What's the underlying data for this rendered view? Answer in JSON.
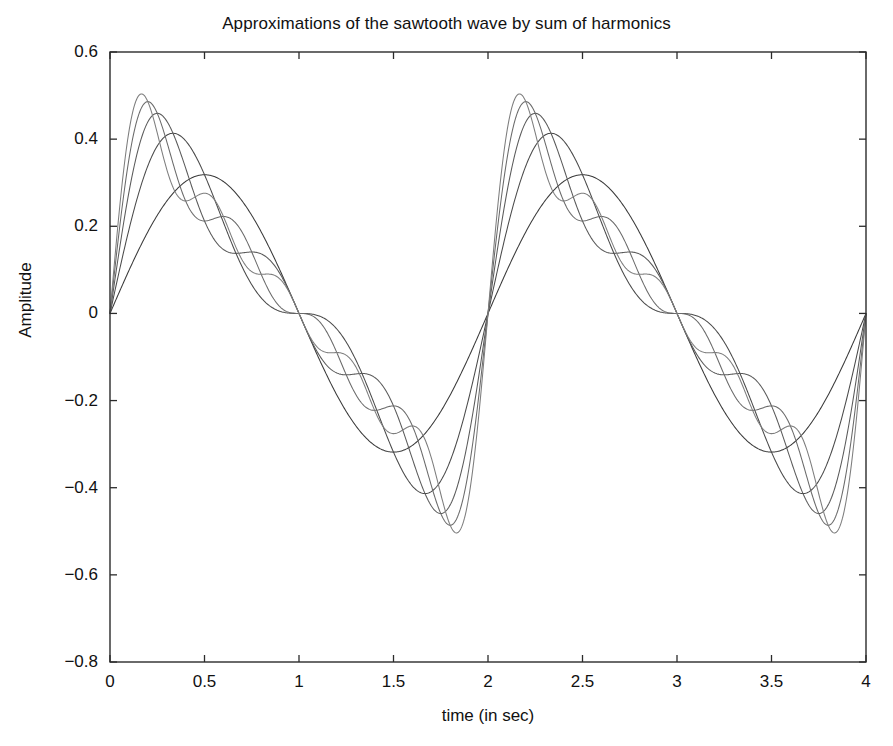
{
  "chart_data": {
    "type": "line",
    "title": "Approximations of the sawtooth wave by sum of harmonics",
    "xlabel": "time (in sec)",
    "ylabel": "Amplitude",
    "xlim": [
      0,
      4
    ],
    "ylim": [
      -0.8,
      0.6
    ],
    "xticks": [
      0,
      0.5,
      1,
      1.5,
      2,
      2.5,
      3,
      3.5,
      4
    ],
    "xticklabels": [
      "0",
      "0.5",
      "1",
      "1.5",
      "2",
      "2.5",
      "3",
      "3.5",
      "4"
    ],
    "yticks": [
      0.6,
      0.4,
      0.2,
      0,
      -0.2,
      -0.4,
      -0.6,
      -0.8
    ],
    "yticklabels": [
      "0.6",
      "0.4",
      "0.2",
      "0",
      "-0.2",
      "-0.4",
      "-0.6",
      "-0.8"
    ],
    "grid": false,
    "legend": "none",
    "background": "#ffffff",
    "axis_color": "#2b2b2b",
    "series": [
      {
        "name": "1 harmonic",
        "harmonics": 1,
        "color": "#3a3a3a",
        "peak": 0.318
      },
      {
        "name": "2 harmonics",
        "harmonics": 2,
        "color": "#4a4a4a",
        "peak": 0.396
      },
      {
        "name": "3 harmonics",
        "harmonics": 3,
        "color": "#5a5a5a",
        "peak": 0.437
      },
      {
        "name": "4 harmonics",
        "harmonics": 4,
        "color": "#6a6a6a",
        "peak": 0.462
      },
      {
        "name": "5 harmonics",
        "harmonics": 5,
        "color": "#7d7d7d",
        "peak": 0.479
      }
    ],
    "period_sec": 2,
    "sawtooth_amplitude": 0.5,
    "samples": 900,
    "zero_crossings": [
      0,
      1,
      2,
      3,
      4
    ],
    "discontinuities": [
      0,
      2,
      4
    ]
  },
  "plot_geometry": {
    "left": 110,
    "right": 866,
    "top": 52,
    "bottom": 662,
    "tick_length": 7
  }
}
